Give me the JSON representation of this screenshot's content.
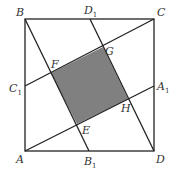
{
  "diagram": {
    "colors": {
      "line": "#222222",
      "fill": "#808080",
      "background": "#ffffff"
    },
    "points": {
      "A": {
        "label": "A",
        "x": 25,
        "y": 151
      },
      "B": {
        "label": "B",
        "x": 25,
        "y": 19
      },
      "C": {
        "label": "C",
        "x": 154,
        "y": 19
      },
      "D": {
        "label": "D",
        "x": 154,
        "y": 151
      },
      "A1": {
        "label": "A",
        "sub": "1",
        "x": 154,
        "y": 86
      },
      "B1": {
        "label": "B",
        "sub": "1",
        "x": 89,
        "y": 151
      },
      "C1": {
        "label": "C",
        "sub": "1",
        "x": 25,
        "y": 86
      },
      "D1": {
        "label": "D",
        "sub": "1",
        "x": 90,
        "y": 19
      },
      "E": {
        "label": "E",
        "x": 77,
        "y": 124
      },
      "F": {
        "label": "F",
        "x": 51,
        "y": 73
      },
      "G": {
        "label": "G",
        "x": 103,
        "y": 47
      },
      "H": {
        "label": "H",
        "x": 128,
        "y": 99
      }
    },
    "segments": [
      [
        "A",
        "B"
      ],
      [
        "B",
        "C"
      ],
      [
        "C",
        "D"
      ],
      [
        "D",
        "A"
      ],
      [
        "B",
        "B1"
      ],
      [
        "D1",
        "D"
      ],
      [
        "C1",
        "C"
      ],
      [
        "A",
        "A1"
      ]
    ],
    "shaded": [
      "E",
      "F",
      "G",
      "H"
    ]
  }
}
